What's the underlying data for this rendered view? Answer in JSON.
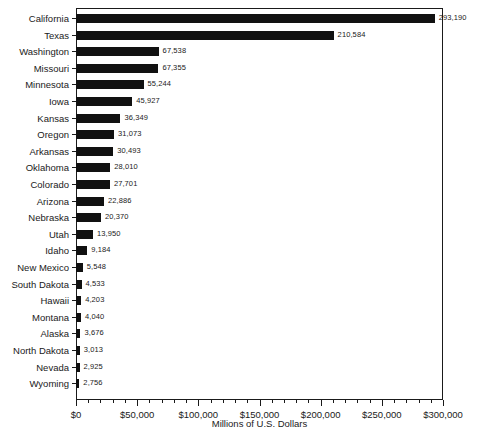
{
  "chart_data": {
    "type": "bar",
    "orientation": "horizontal",
    "title": "",
    "xlabel": "Millions of U.S. Dollars",
    "ylabel": "",
    "xlim": [
      0,
      300000
    ],
    "xticks": [
      0,
      50000,
      100000,
      150000,
      200000,
      250000,
      300000
    ],
    "xtick_labels": [
      "$0",
      "$50,000",
      "$100,000",
      "$150,000",
      "$200,000",
      "$250,000",
      "$300,000"
    ],
    "minor_tick_step": 10000,
    "grid": false,
    "legend": null,
    "bar_color": "#111111",
    "categories": [
      "California",
      "Texas",
      "Washington",
      "Missouri",
      "Minnesota",
      "Iowa",
      "Kansas",
      "Oregon",
      "Arkansas",
      "Oklahoma",
      "Colorado",
      "Arizona",
      "Nebraska",
      "Utah",
      "Idaho",
      "New Mexico",
      "South Dakota",
      "Hawaii",
      "Montana",
      "Alaska",
      "North Dakota",
      "Nevada",
      "Wyoming"
    ],
    "values": [
      293190,
      210584,
      67538,
      67355,
      55244,
      45927,
      36349,
      31073,
      30493,
      28010,
      27701,
      22886,
      20370,
      13950,
      9184,
      5548,
      4533,
      4203,
      4040,
      3676,
      3013,
      2925,
      2756
    ],
    "value_labels": [
      "293,190",
      "210,584",
      "67,538",
      "67,355",
      "55,244",
      "45,927",
      "36,349",
      "31,073",
      "30,493",
      "28,010",
      "27,701",
      "22,886",
      "20,370",
      "13,950",
      "9,184",
      "5,548",
      "4,533",
      "4,203",
      "4,040",
      "3,676",
      "3,013",
      "2,925",
      "2,756"
    ]
  },
  "footer": {
    "clipped_text": ""
  }
}
